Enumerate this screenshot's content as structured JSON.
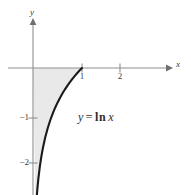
{
  "figure": {
    "background_color": "#ffffff",
    "width": 191,
    "height": 195
  },
  "axes": {
    "x_axis_label": "x",
    "y_axis_label": "y",
    "axis_color": "#8c8c8c",
    "origin_px": {
      "x": 33,
      "y": 68
    },
    "x_ticks": [
      {
        "value": "1",
        "px": 82
      },
      {
        "value": "2",
        "px": 120
      }
    ],
    "y_ticks": [
      {
        "value": "−1",
        "px": 118
      },
      {
        "value": "−2",
        "px": 163
      }
    ]
  },
  "annotation": {
    "equation_y": "y",
    "equation_equals": "=",
    "equation_fn": "ln",
    "equation_arg": "x",
    "equation_full": "y = ln x"
  },
  "chart_data": {
    "type": "line",
    "title": "",
    "subtitle": "",
    "xlabel": "x",
    "ylabel": "y",
    "xlim": [
      -0.66,
      3.6
    ],
    "ylim": [
      -2.7,
      1.02
    ],
    "grid": false,
    "legend": null,
    "curve_color": "#1a1a1a",
    "shade_color": "#e9e9e9",
    "annotations": [
      {
        "text": "y = ln x",
        "x": 1.18,
        "y": -1.07
      }
    ],
    "series": [
      {
        "name": "y = ln x",
        "equation": "y = ln(x)",
        "x": [
          0.055,
          0.07,
          0.09,
          0.11,
          0.14,
          0.17,
          0.2,
          0.25,
          0.3,
          0.35,
          0.4,
          0.45,
          0.5,
          0.55,
          0.6,
          0.65,
          0.7,
          0.75,
          0.8,
          0.85,
          0.9,
          0.95,
          1.0
        ],
        "values": [
          -2.9,
          -2.659,
          -2.408,
          -2.207,
          -1.966,
          -1.772,
          -1.609,
          -1.386,
          -1.204,
          -1.05,
          -0.916,
          -0.799,
          -0.693,
          -0.598,
          -0.511,
          -0.431,
          -0.357,
          -0.288,
          -0.223,
          -0.163,
          -0.105,
          -0.051,
          0.0
        ]
      }
    ],
    "shaded_region": {
      "description": "Region bounded by the y-axis, the x-axis and the curve y = ln x from x=0 to x=1",
      "x_range": [
        0,
        1
      ],
      "between": [
        "y = ln x",
        "y = 0"
      ]
    }
  }
}
